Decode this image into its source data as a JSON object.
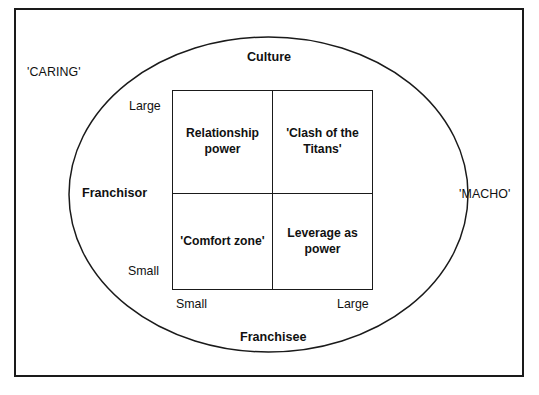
{
  "diagram": {
    "title_axes": {
      "top": "Culture",
      "bottom": "Franchisee",
      "left_vertical_axis": "Franchisor",
      "left_outside": "'CARING'",
      "right_outside": "'MACHO'"
    },
    "y_axis": {
      "high_label": "Large",
      "low_label": "Small"
    },
    "x_axis": {
      "low_label": "Small",
      "high_label": "Large"
    },
    "quadrants": [
      {
        "position": "top-left",
        "label": "Relationship power"
      },
      {
        "position": "top-right",
        "label": "'Clash of the Titans'"
      },
      {
        "position": "bottom-left",
        "label": "'Comfort zone'"
      },
      {
        "position": "bottom-right",
        "label": "Leverage as power"
      }
    ],
    "colors": {
      "stroke": "#1a1a1a",
      "text": "#111111",
      "background": "#ffffff"
    }
  }
}
